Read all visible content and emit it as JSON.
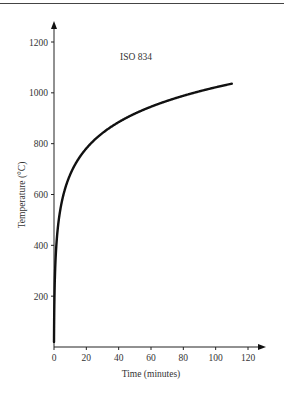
{
  "chart_data": {
    "type": "line",
    "title": "",
    "annotation": "ISO 834",
    "xlabel": "Time (minutes)",
    "ylabel": "Temperature (°C)",
    "xlim": [
      0,
      120
    ],
    "ylim": [
      0,
      1200
    ],
    "xticks": [
      "0",
      "20",
      "40",
      "60",
      "80",
      "100",
      "120"
    ],
    "yticks": [
      "200",
      "400",
      "600",
      "800",
      "1000",
      "1200"
    ],
    "grid": false,
    "legend": "none",
    "series": [
      {
        "name": "ISO 834",
        "formula": "T = 345 log10(8t + 1) + 20",
        "x": [
          0,
          1,
          2,
          5,
          10,
          15,
          20,
          30,
          40,
          50,
          60,
          70,
          80,
          90,
          100,
          110
        ],
        "y": [
          20,
          349,
          445,
          576,
          678,
          739,
          781,
          842,
          885,
          918,
          945,
          968,
          988,
          1006,
          1022,
          1036
        ]
      }
    ],
    "color": "#111111"
  }
}
